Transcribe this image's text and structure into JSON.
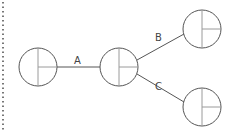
{
  "diagram": {
    "type": "tree",
    "colors": {
      "stroke": "#555555",
      "inner_stroke": "#9a9a9a",
      "dotted_border": "#555555",
      "label": "#444444",
      "background": "#ffffff"
    },
    "nodes": [
      {
        "id": "root",
        "cx": 38,
        "cy": 67,
        "r": 19
      },
      {
        "id": "middle",
        "cx": 119,
        "cy": 67,
        "r": 19
      },
      {
        "id": "top-right",
        "cx": 202,
        "cy": 29,
        "r": 19
      },
      {
        "id": "bottom-right",
        "cx": 202,
        "cy": 107,
        "r": 19
      }
    ],
    "edges": [
      {
        "from": "root",
        "to": "middle",
        "label": "A"
      },
      {
        "from": "middle",
        "to": "top-right",
        "label": "B"
      },
      {
        "from": "middle",
        "to": "bottom-right",
        "label": "C"
      }
    ]
  }
}
